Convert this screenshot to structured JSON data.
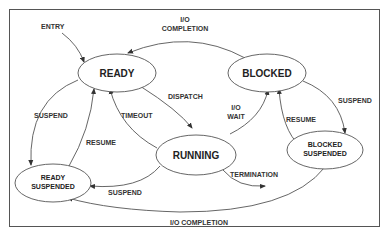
{
  "diagram": {
    "type": "state-transition",
    "states": {
      "ready": "READY",
      "blocked": "BLOCKED",
      "running": "RUNNING",
      "ready_suspended_line1": "READY",
      "ready_suspended_line2": "SUSPENDED",
      "blocked_suspended_line1": "BLOCKED",
      "blocked_suspended_line2": "SUSPENDED"
    },
    "transitions": {
      "entry": "ENTRY",
      "io_completion_top_line1": "I/O",
      "io_completion_top_line2": "COMPLETION",
      "dispatch": "DISPATCH",
      "timeout": "TIMEOUT",
      "io_wait_line1": "I/O",
      "io_wait_line2": "WAIT",
      "suspend_left": "SUSPEND",
      "resume_left": "RESUME",
      "suspend_right": "SUSPEND",
      "resume_right": "RESUME",
      "suspend_bottom": "SUSPEND",
      "termination": "TERMINATION",
      "io_completion_bottom": "I/O COMPLETION"
    },
    "edges": [
      {
        "from": "ENTRY",
        "to": "READY",
        "label": "ENTRY"
      },
      {
        "from": "BLOCKED",
        "to": "READY",
        "label": "I/O COMPLETION"
      },
      {
        "from": "READY",
        "to": "RUNNING",
        "label": "DISPATCH"
      },
      {
        "from": "RUNNING",
        "to": "READY",
        "label": "TIMEOUT"
      },
      {
        "from": "RUNNING",
        "to": "BLOCKED",
        "label": "I/O WAIT"
      },
      {
        "from": "READY",
        "to": "READY SUSPENDED",
        "label": "SUSPEND"
      },
      {
        "from": "READY SUSPENDED",
        "to": "READY",
        "label": "RESUME"
      },
      {
        "from": "RUNNING",
        "to": "READY SUSPENDED",
        "label": "SUSPEND"
      },
      {
        "from": "BLOCKED",
        "to": "BLOCKED SUSPENDED",
        "label": "SUSPEND"
      },
      {
        "from": "BLOCKED SUSPENDED",
        "to": "BLOCKED",
        "label": "RESUME"
      },
      {
        "from": "RUNNING",
        "to": "EXIT",
        "label": "TERMINATION"
      },
      {
        "from": "BLOCKED SUSPENDED",
        "to": "READY SUSPENDED",
        "label": "I/O COMPLETION"
      }
    ]
  }
}
